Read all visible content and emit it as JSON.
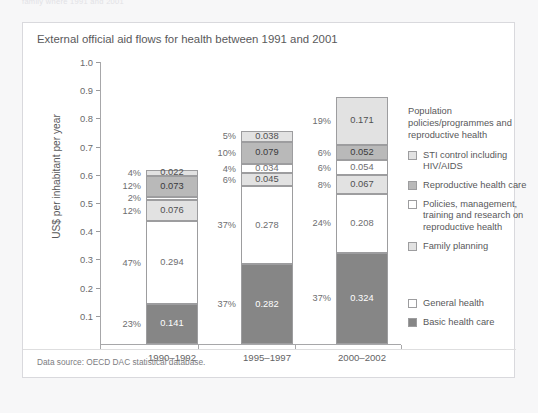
{
  "page_header_fragment": "family where 1991 and 2001",
  "figure": {
    "title": "External official aid flows for health between 1991 and 2001",
    "source_note": "Data source: OECD DAC statistical database."
  },
  "legend": {
    "group1_heading": "Population policies/programmes and reproductive health",
    "items": [
      {
        "label": "STI control including HIV/AIDS",
        "swatch": "light"
      },
      {
        "label": "Reproductive health care",
        "swatch": "mid"
      },
      {
        "label": "Policies, management, training and research on reproductive health",
        "swatch": "white"
      },
      {
        "label": "Family planning",
        "swatch": "light"
      }
    ],
    "group2_items": [
      {
        "label": "General health",
        "swatch": "white"
      },
      {
        "label": "Basic health care",
        "swatch": "dark"
      }
    ]
  },
  "chart_data": {
    "type": "bar",
    "subtype": "stacked-vertical",
    "title": "External official aid flows for health between 1991 and 2001",
    "xlabel": "",
    "ylabel": "US$ per inhabitant per year",
    "ylim": [
      0.0,
      1.0
    ],
    "yticks": [
      "1.0",
      "0.9",
      "0.8",
      "0.7",
      "0.6",
      "0.5",
      "0.4",
      "0.3",
      "0.2",
      "0.1"
    ],
    "grid": false,
    "legend_position": "right",
    "categories": [
      "1990–1992",
      "1995–1997",
      "2000–2002"
    ],
    "series": [
      {
        "name": "Basic health care",
        "swatch": "dark",
        "values": [
          0.141,
          0.282,
          0.324
        ],
        "value_labels": [
          "0.141",
          "0.282",
          "0.324"
        ],
        "pct_labels": [
          "23%",
          "37%",
          "37%"
        ]
      },
      {
        "name": "General health",
        "swatch": "white",
        "values": [
          0.294,
          0.278,
          0.208
        ],
        "value_labels": [
          "0.294",
          "0.278",
          "0.208"
        ],
        "pct_labels": [
          "47%",
          "37%",
          "24%"
        ]
      },
      {
        "name": "Family planning",
        "swatch": "light",
        "values": [
          0.076,
          0.045,
          0.067
        ],
        "value_labels": [
          "0.076",
          "0.045",
          "0.067"
        ],
        "pct_labels": [
          "12%",
          "6%",
          "8%"
        ]
      },
      {
        "name": "Policies, management, training and research on reproductive health",
        "swatch": "white",
        "values": [
          0.012,
          0.034,
          0.054
        ],
        "value_labels": [
          "",
          "0.034",
          "0.054"
        ],
        "pct_labels": [
          "2%",
          "4%",
          "6%"
        ]
      },
      {
        "name": "Reproductive health care",
        "swatch": "mid",
        "values": [
          0.073,
          0.079,
          0.052
        ],
        "value_labels": [
          "0.073",
          "0.079",
          "0.052"
        ],
        "pct_labels": [
          "12%",
          "10%",
          "6%"
        ]
      },
      {
        "name": "STI control including HIV/AIDS",
        "swatch": "light",
        "values": [
          0.022,
          0.038,
          0.171
        ],
        "value_labels": [
          "0.022",
          "0.038",
          "0.171"
        ],
        "pct_labels": [
          "4%",
          "5%",
          "19%"
        ]
      }
    ],
    "totals": [
      0.618,
      0.756,
      0.876
    ]
  }
}
